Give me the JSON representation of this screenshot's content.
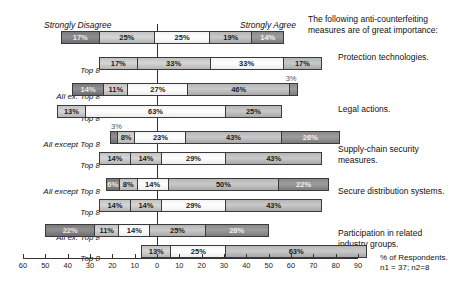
{
  "header": {
    "left_anchor": "Strongly Disagree",
    "right_anchor": "Strongly Agree",
    "question_stem": "The following anti-counterfeiting measures are of great importance:"
  },
  "axis": {
    "title": "% of Respondents.",
    "sample_note": "n1 = 37; n2=8",
    "tick_labels": [
      "60",
      "50",
      "40",
      "30",
      "20",
      "10",
      "0",
      "10",
      "20",
      "30",
      "40",
      "50",
      "60",
      "70",
      "80",
      "90"
    ],
    "tick_values": [
      -60,
      -50,
      -40,
      -30,
      -20,
      -10,
      0,
      10,
      20,
      30,
      40,
      50,
      60,
      70,
      80,
      90
    ],
    "min": -60,
    "max": 90
  },
  "series_labels": {
    "all_except": "All except Top 8",
    "all_except_short": "All ex. Top 8",
    "top8": "Top 8",
    "blank": ""
  },
  "categories": [
    "Protection technologies.",
    "Legal actions.",
    "Supply-chain security measures.",
    "Secure distribution systems.",
    "Participation in related industry groups."
  ],
  "chart_data": {
    "type": "bar",
    "subtype": "diverging-stacked-likert",
    "title": "The following anti-counterfeiting measures are of great importance:",
    "xlabel": "% of Respondents.",
    "ylabel": "",
    "xlim": [
      -60,
      90
    ],
    "grid": false,
    "legend": false,
    "annotations": [
      "Strongly Disagree",
      "Strongly Agree",
      "n1 = 37; n2=8"
    ],
    "likert_levels": [
      "Strongly Disagree",
      "Disagree",
      "Neutral",
      "Agree",
      "Strongly Agree"
    ],
    "note": "Values are percentages of respondents; bars are centred so that the left edge of the middle (Neutral) segment is offset to place the Neutral midpoint near 0.",
    "rows": [
      {
        "category": "Protection technologies.",
        "group": "All except Top 8",
        "group_label": "",
        "start": -43,
        "values": [
          17,
          25,
          25,
          19,
          14
        ],
        "labels": [
          "17%",
          "25%",
          "25%",
          "19%",
          "14%"
        ],
        "outside_label": ""
      },
      {
        "category": "Protection technologies.",
        "group": "Top 8",
        "group_label": "Top 8",
        "start": -26,
        "values": [
          17,
          33,
          33,
          17
        ],
        "labels": [
          "17%",
          "33%",
          "33%",
          "17%"
        ],
        "outside_label": ""
      },
      {
        "category": "Legal actions.",
        "group": "All ex. Top 8",
        "group_label": "All ex. Top 8",
        "start": -38,
        "values": [
          14,
          11,
          27,
          46,
          3
        ],
        "labels": [
          "14%",
          "11%",
          "27%",
          "46%",
          ""
        ],
        "outside_label": "3%"
      },
      {
        "category": "Legal actions.",
        "group": "Top 8",
        "group_label": "Top 8",
        "start": -45,
        "values": [
          13,
          63,
          25
        ],
        "labels": [
          "13%",
          "63%",
          "25%"
        ],
        "outside_label": ""
      },
      {
        "category": "Supply-chain security measures.",
        "group": "All except Top 8",
        "group_label": "All except Top 8",
        "start": -21,
        "values": [
          3,
          8,
          23,
          43,
          26
        ],
        "labels": [
          "",
          "8%",
          "23%",
          "43%",
          "26%"
        ],
        "outside_label": "3%"
      },
      {
        "category": "Supply-chain security measures.",
        "group": "Top 8",
        "group_label": "Top 8",
        "start": -26,
        "values": [
          14,
          14,
          29,
          43
        ],
        "labels": [
          "14%",
          "14%",
          "29%",
          "43%"
        ],
        "outside_label": ""
      },
      {
        "category": "Secure distribution systems.",
        "group": "All except Top 8",
        "group_label": "All except Top 8",
        "start": -23,
        "values": [
          6,
          8,
          14,
          50,
          22
        ],
        "labels": [
          "6%",
          "8%",
          "14%",
          "50%",
          "22%"
        ],
        "outside_label": ""
      },
      {
        "category": "Secure distribution systems.",
        "group": "Top 8",
        "group_label": "Top 8",
        "start": -26,
        "values": [
          14,
          14,
          29,
          43
        ],
        "labels": [
          "14%",
          "14%",
          "29%",
          "43%"
        ],
        "outside_label": ""
      },
      {
        "category": "Participation in related industry groups.",
        "group": "All ex. Top 8",
        "group_label": "All ex. Top 8",
        "start": -50,
        "values": [
          22,
          11,
          14,
          25,
          28
        ],
        "labels": [
          "22%",
          "11%",
          "14%",
          "25%",
          "28%"
        ],
        "outside_label": ""
      },
      {
        "category": "Participation in related industry groups.",
        "group": "Top 8",
        "group_label": "Top 8",
        "start": -7,
        "values": [
          13,
          25,
          63
        ],
        "labels": [
          "13%",
          "25%",
          "63%"
        ],
        "outside_label": ""
      }
    ]
  }
}
